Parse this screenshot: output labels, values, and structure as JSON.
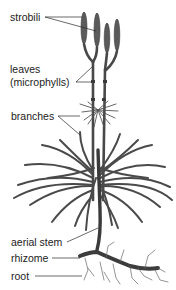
{
  "diagram": {
    "colors": {
      "plant": "#4a4a4a",
      "plant_dark": "#333333",
      "leader_line": "#2a2a2a",
      "label_text": "#222222",
      "background": "#ffffff"
    },
    "labels": [
      {
        "id": "strobili",
        "text": "strobili",
        "x": 10,
        "y": 11
      },
      {
        "id": "leaves",
        "text": "leaves",
        "x": 10,
        "y": 63
      },
      {
        "id": "microphylls",
        "text": "(microphylls)",
        "x": 10,
        "y": 76
      },
      {
        "id": "branches",
        "text": "branches",
        "x": 11,
        "y": 110
      },
      {
        "id": "aerial-stem",
        "text": "aerial stem",
        "x": 11,
        "y": 236
      },
      {
        "id": "rhizome",
        "text": "rhizome",
        "x": 11,
        "y": 252
      },
      {
        "id": "root",
        "text": "root",
        "x": 11,
        "y": 270
      }
    ]
  }
}
